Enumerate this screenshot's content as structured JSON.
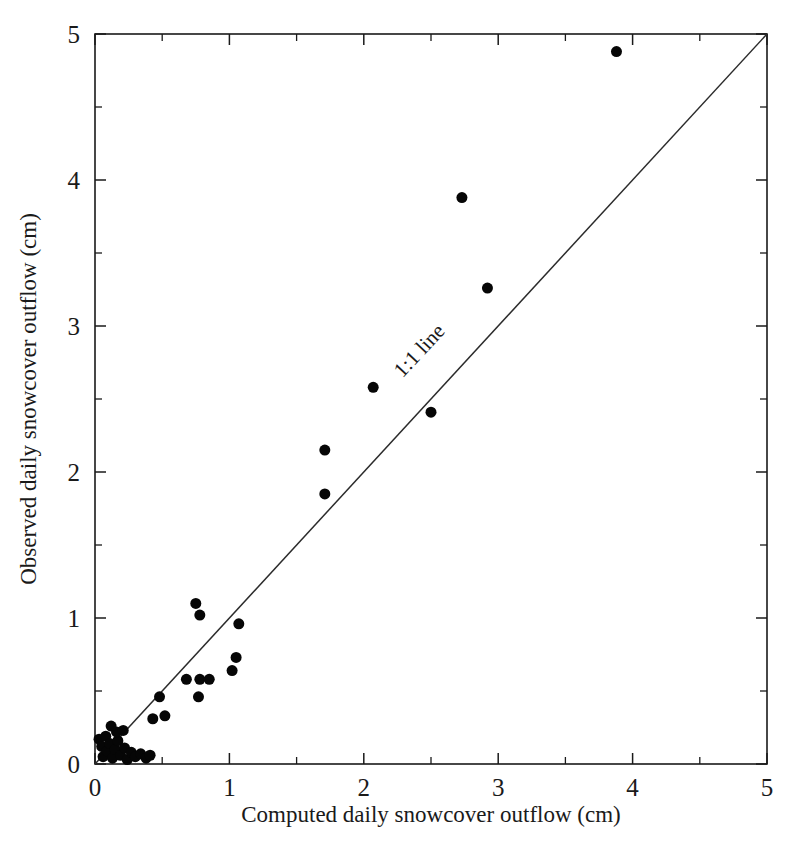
{
  "chart_data": {
    "type": "scatter",
    "title": "",
    "xlabel": "Computed daily snowcover outflow (cm)",
    "ylabel": "Observed daily snowcover outflow (cm)",
    "xlim": [
      0,
      5
    ],
    "ylim": [
      0,
      5
    ],
    "xticks": [
      0,
      1,
      2,
      3,
      4,
      5
    ],
    "yticks": [
      0,
      1,
      2,
      3,
      4,
      5
    ],
    "xticklabels": [
      "0",
      "1",
      "2",
      "3",
      "4",
      "5"
    ],
    "yticklabels": [
      "0",
      "1",
      "2",
      "3",
      "4",
      "5"
    ],
    "minor_ticks_per_interval": 1,
    "grid": false,
    "legend": null,
    "annotations": [
      {
        "text": "1:1 line",
        "x": 2.45,
        "y": 2.8,
        "rotation_deg": -47
      }
    ],
    "reference_line": {
      "label": "1:1 line",
      "type": "identity",
      "slope": 1,
      "intercept": 0,
      "from": [
        0,
        0
      ],
      "to": [
        5,
        5
      ]
    },
    "series": [
      {
        "name": "Daily snowcover outflow",
        "marker": "filled-circle",
        "marker_color": "#060606",
        "marker_size_px": 11,
        "points": [
          [
            0.03,
            0.17
          ],
          [
            0.05,
            0.12
          ],
          [
            0.06,
            0.05
          ],
          [
            0.08,
            0.19
          ],
          [
            0.09,
            0.09
          ],
          [
            0.11,
            0.14
          ],
          [
            0.13,
            0.04
          ],
          [
            0.15,
            0.1
          ],
          [
            0.17,
            0.16
          ],
          [
            0.19,
            0.06
          ],
          [
            0.22,
            0.11
          ],
          [
            0.24,
            0.03
          ],
          [
            0.27,
            0.08
          ],
          [
            0.3,
            0.05
          ],
          [
            0.34,
            0.07
          ],
          [
            0.38,
            0.04
          ],
          [
            0.41,
            0.06
          ],
          [
            0.16,
            0.22
          ],
          [
            0.21,
            0.23
          ],
          [
            0.12,
            0.26
          ],
          [
            0.43,
            0.31
          ],
          [
            0.52,
            0.33
          ],
          [
            0.48,
            0.46
          ],
          [
            0.68,
            0.58
          ],
          [
            0.78,
            0.58
          ],
          [
            0.85,
            0.58
          ],
          [
            0.77,
            0.46
          ],
          [
            1.02,
            0.64
          ],
          [
            1.05,
            0.73
          ],
          [
            1.07,
            0.96
          ],
          [
            0.75,
            1.1
          ],
          [
            0.78,
            1.02
          ],
          [
            1.71,
            1.85
          ],
          [
            1.71,
            2.15
          ],
          [
            2.07,
            2.58
          ],
          [
            2.5,
            2.41
          ],
          [
            2.92,
            3.26
          ],
          [
            2.73,
            3.88
          ],
          [
            3.88,
            4.88
          ]
        ]
      }
    ]
  },
  "figure": {
    "plot_area_px": {
      "left": 95,
      "top": 34,
      "right": 767,
      "bottom": 764
    }
  }
}
